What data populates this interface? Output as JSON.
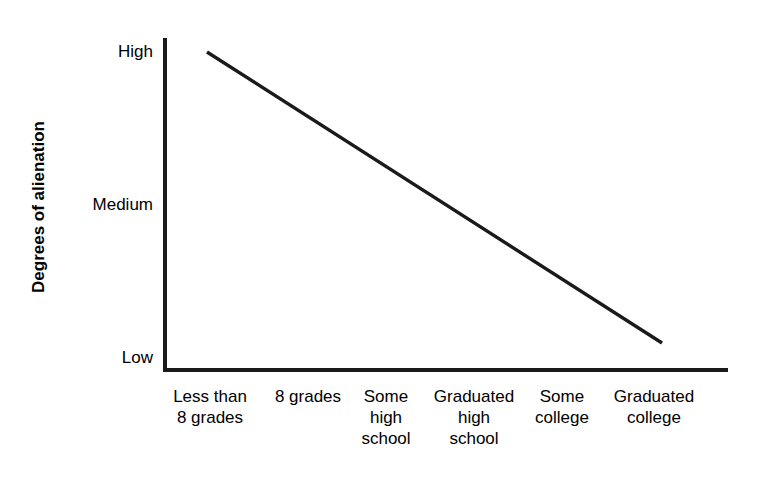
{
  "chart_data": {
    "type": "line",
    "title": "",
    "xlabel": "",
    "ylabel": "Degrees of alienation",
    "grid": false,
    "legend": "none",
    "categories": [
      "Less than\n8 grades",
      "8 grades",
      "Some\nhigh\nschool",
      "Graduated\nhigh\nschool",
      "Some\ncollege",
      "Graduated\ncollege"
    ],
    "y_tick_labels": [
      "High",
      "Medium",
      "Low"
    ],
    "ylim": [
      "Low",
      "High"
    ],
    "series": [
      {
        "name": "Alienation",
        "x": [
          "Less than 8 grades",
          "8 grades",
          "Some high school",
          "Graduated high school",
          "Some college",
          "Graduated college"
        ],
        "values": [
          1.0,
          0.8,
          0.6,
          0.4,
          0.2,
          0.06
        ],
        "value_labels": [
          "High",
          "between High and Medium",
          "between High and Medium",
          "between Medium and Low",
          "between Medium and Low",
          "Low"
        ],
        "color": "#1a1a1a",
        "line_width": 3
      }
    ]
  },
  "axes": {
    "y_title": "Degrees of alienation",
    "y_labels": {
      "high": "High",
      "medium": "Medium",
      "low": "Low"
    },
    "x_labels": [
      "Less than\n8 grades",
      "8 grades",
      "Some\nhigh\nschool",
      "Graduated\nhigh\nschool",
      "Some\ncollege",
      "Graduated\ncollege"
    ]
  },
  "colors": {
    "background": "#ffffff",
    "axis": "#1a1a1a",
    "line": "#1a1a1a",
    "text": "#000000"
  }
}
